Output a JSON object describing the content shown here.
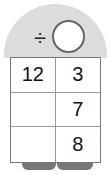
{
  "operator": {
    "symbol": "÷",
    "icon": "divide-icon"
  },
  "answer_circle": {
    "value": ""
  },
  "table": {
    "rows": [
      [
        "12",
        "3"
      ],
      [
        "",
        "7"
      ],
      [
        "",
        "8"
      ]
    ]
  },
  "colors": {
    "dome": "#dcdcdc",
    "border": "#777777",
    "tab": "#777777"
  }
}
